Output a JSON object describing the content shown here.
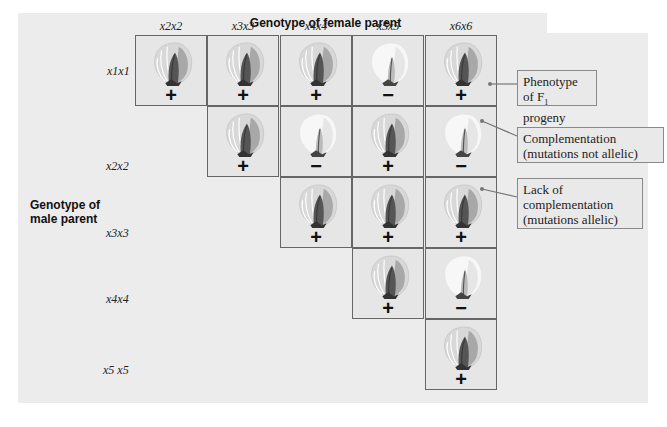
{
  "title": "Genotype of female parent",
  "male_label_line1": "Genotype of",
  "male_label_line2": "male parent",
  "columns": [
    "x2x2",
    "x3x3",
    "x4x4",
    "x5x5",
    "x6x6"
  ],
  "rows": [
    "x1x1",
    "x2x2",
    "x3x3",
    "x4x4",
    "x5 x5"
  ],
  "cells": [
    [
      {
        "sign": "+",
        "phenotype": "wild-type"
      },
      {
        "sign": "+",
        "phenotype": "wild-type"
      },
      {
        "sign": "+",
        "phenotype": "wild-type"
      },
      {
        "sign": "−",
        "phenotype": "white"
      },
      {
        "sign": "+",
        "phenotype": "wild-type"
      }
    ],
    [
      null,
      {
        "sign": "+",
        "phenotype": "wild-type"
      },
      {
        "sign": "−",
        "phenotype": "white"
      },
      {
        "sign": "+",
        "phenotype": "wild-type"
      },
      {
        "sign": "−",
        "phenotype": "white"
      }
    ],
    [
      null,
      null,
      {
        "sign": "+",
        "phenotype": "wild-type"
      },
      {
        "sign": "+",
        "phenotype": "wild-type"
      },
      {
        "sign": "+",
        "phenotype": "wild-type"
      }
    ],
    [
      null,
      null,
      null,
      {
        "sign": "+",
        "phenotype": "wild-type"
      },
      {
        "sign": "−",
        "phenotype": "white"
      }
    ],
    [
      null,
      null,
      null,
      null,
      {
        "sign": "+",
        "phenotype": "wild-type"
      }
    ]
  ],
  "callouts": {
    "phenotype": {
      "line1": "Phenotype",
      "line2_prefix": "of F",
      "line2_sub": "1",
      "line2_suffix": " progeny"
    },
    "complementation": {
      "line1": "Complementation",
      "line2": "(mutations not allelic)"
    },
    "lack": {
      "line1": "Lack of",
      "line2": "complementation",
      "line3": "(mutations allelic)"
    }
  },
  "colors": {
    "panel": "#ececec",
    "border": "#666666",
    "callout_border": "#8a8a8a"
  }
}
